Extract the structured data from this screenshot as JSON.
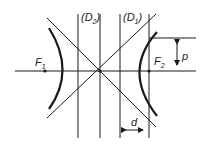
{
  "diagram": {
    "colors": {
      "background": "#ffffff",
      "stroke": "#1a1a1a"
    },
    "labels": {
      "D2": {
        "main": "(D",
        "sub": "2",
        "close": ")"
      },
      "D1": {
        "main": "(D",
        "sub": "1",
        "close": ")"
      },
      "F1": {
        "main": "F",
        "sub": "1"
      },
      "F2": {
        "main": "F",
        "sub": "2"
      },
      "p": "p",
      "d": "d"
    }
  }
}
